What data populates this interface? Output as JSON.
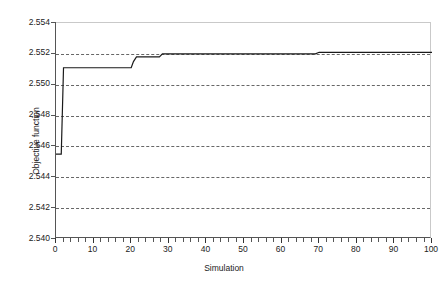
{
  "chart_data": {
    "type": "line",
    "title": "",
    "subtitle": "",
    "xlabel": "Simulation",
    "ylabel": "Objective function",
    "xlim": [
      0,
      100
    ],
    "ylim": [
      2.54,
      2.554
    ],
    "xticks": [
      0,
      10,
      20,
      30,
      40,
      50,
      60,
      70,
      80,
      90,
      100
    ],
    "xtick_labels": [
      "0",
      "10",
      "20",
      "30",
      "40",
      "50",
      "60",
      "70",
      "80",
      "90",
      "100"
    ],
    "yticks": [
      2.54,
      2.542,
      2.544,
      2.546,
      2.548,
      2.55,
      2.552,
      2.554
    ],
    "ytick_labels": [
      "2.540",
      "2.542",
      "2.544",
      "2.546",
      "2.548",
      "2.550",
      "2.552",
      "2.554"
    ],
    "x_minor_tick_interval": 2,
    "grid": {
      "horizontal": true,
      "vertical": false,
      "style": "dashed",
      "color": "#4d4d4d"
    },
    "legend": null,
    "series": [
      {
        "name": "Objective function",
        "color": "#1a1a1a",
        "line_width": 1.2,
        "style": "step",
        "x": [
          0,
          1,
          1.4,
          2,
          20,
          20.6,
          21.4,
          27.5,
          28.3,
          69,
          70,
          100
        ],
        "values": [
          2.5455,
          2.5455,
          2.5455,
          2.5511,
          2.5511,
          2.5515,
          2.5518,
          2.5518,
          2.552,
          2.552,
          2.5521,
          2.5521
        ]
      }
    ],
    "annotations": []
  },
  "axes": {
    "y_title": "Objective function",
    "x_title": "Simulation"
  }
}
